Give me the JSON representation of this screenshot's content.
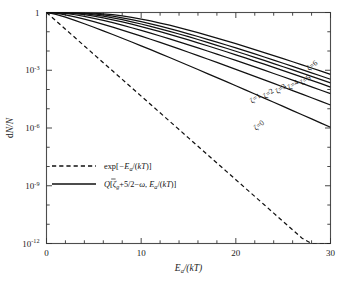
{
  "figure": {
    "kind": "semilog-line-plot",
    "background": "#ffffff",
    "frame_color": "#4d4d4d",
    "curve_color": "#111111"
  },
  "axes": {
    "x": {
      "label_parts": {
        "var": "E",
        "subscript": "a",
        "div": "/(",
        "k": "k",
        "T": "T",
        "close": ")"
      },
      "label": "Ea/(kT)",
      "ticks": [
        "0",
        "10",
        "20",
        "30"
      ],
      "tick_values": [
        0,
        10,
        20,
        30
      ],
      "minor_step": 2,
      "range": [
        0,
        30
      ],
      "scale": "linear"
    },
    "y": {
      "label": "dN/N",
      "label_parts": {
        "d": "d",
        "N1": "N",
        "slash": "/",
        "N2": "N"
      },
      "ticks": [
        {
          "mantissa": "1",
          "exponent": ""
        },
        {
          "mantissa": "10",
          "exponent": "-3"
        },
        {
          "mantissa": "10",
          "exponent": "-6"
        },
        {
          "mantissa": "10",
          "exponent": "-9"
        },
        {
          "mantissa": "10",
          "exponent": "-12"
        }
      ],
      "tick_exponents": [
        0,
        -3,
        -6,
        -9,
        -12
      ],
      "range": [
        -12,
        0
      ],
      "scale": "log10"
    }
  },
  "legend": {
    "position": "center-left",
    "entries": [
      {
        "style": "dashed",
        "text": "exp[-Ea/(kT)]",
        "parts": {
          "fn": "exp[",
          "minus": "−",
          "E": "E",
          "sub": "a",
          "div": "/(",
          "k": "k",
          "T": "T",
          "tail": ")]"
        }
      },
      {
        "style": "solid",
        "text": "Q[ζg+5/2-ω, Ea/(kT)]",
        "parts": {
          "Q": "Q",
          "open": "[",
          "zeta": "ζ",
          "zsub": "g",
          "mid": "+5/2",
          "minus": "−",
          "omega": "ω",
          "comma": ", ",
          "E": "E",
          "esub": "a",
          "div": "/(",
          "k": "k",
          "T": "T",
          "tail": ")]"
        }
      }
    ]
  },
  "curve_labels": [
    {
      "id": "zeta-0",
      "zeta": "0",
      "text": "ζ=0",
      "x_data": 22.6,
      "y_exp": -5.95,
      "rotation": -38
    },
    {
      "id": "zeta-1",
      "zeta": "1",
      "text": "ζ=1",
      "x_data": 22.2,
      "y_exp": -4.55,
      "rotation": -38
    },
    {
      "id": "zeta-2",
      "zeta": "2",
      "text": "ζ=2",
      "x_data": 23.6,
      "y_exp": -4.3,
      "rotation": -38
    },
    {
      "id": "zeta-3",
      "zeta": "3",
      "text": "ζ=3",
      "x_data": 24.9,
      "y_exp": -4.05,
      "rotation": -38
    },
    {
      "id": "zeta-4",
      "zeta": "4",
      "text": "ζ=4",
      "x_data": 26.2,
      "y_exp": -3.85,
      "rotation": -38
    },
    {
      "id": "zeta-5",
      "zeta": "5",
      "text": "ζ=5",
      "x_data": 27.5,
      "y_exp": -3.6,
      "rotation": -38
    },
    {
      "id": "zeta-6",
      "zeta": "6",
      "text": "ζ=6",
      "x_data": 28.2,
      "y_exp": -2.85,
      "rotation": -38
    }
  ],
  "chart_data": {
    "type": "line",
    "title": "",
    "xlabel": "Ea/(kT)",
    "ylabel": "dN/N",
    "xlim": [
      0,
      30
    ],
    "ylim": [
      1e-12,
      1
    ],
    "yscale": "log",
    "grid": false,
    "legend_position": "center-left",
    "x": [
      0,
      1,
      2,
      3,
      4,
      5,
      6,
      7,
      8,
      9,
      10,
      11,
      12,
      13,
      14,
      15,
      16,
      17,
      18,
      19,
      20,
      21,
      22,
      23,
      24,
      25,
      26,
      27,
      28,
      29,
      30
    ],
    "series": [
      {
        "name": "exp[-Ea/(kT)]",
        "style": "dashed",
        "shape_param": null,
        "values": [
          1,
          0.368,
          0.135,
          0.0498,
          0.0183,
          0.00674,
          0.00248,
          0.000912,
          0.000335,
          0.000123,
          4.54e-05,
          1.67e-05,
          6.14e-06,
          2.26e-06,
          8.32e-07,
          3.06e-07,
          1.13e-07,
          4.14e-08,
          1.52e-08,
          5.6e-09,
          2.06e-09,
          7.58e-10,
          2.79e-10,
          1.03e-10,
          3.78e-11,
          1.39e-11,
          5.11e-12,
          1.88e-12,
          6.91e-13,
          2.54e-13,
          9.36e-14
        ]
      },
      {
        "name": "ζ=0",
        "style": "solid",
        "shape_param": 1.5,
        "values": [
          1,
          0.801,
          0.572,
          0.391,
          0.261,
          0.172,
          0.112,
          0.072,
          0.0462,
          0.0295,
          0.0186,
          0.0117,
          0.00734,
          0.00458,
          0.00285,
          0.00177,
          0.00109,
          0.000674,
          0.000415,
          0.000255,
          0.000156,
          9.56e-05,
          5.84e-05,
          3.56e-05,
          2.17e-05,
          1.32e-05,
          8.03e-06,
          4.88e-06,
          2.96e-06,
          1.8e-06,
          1.09e-06
        ]
      },
      {
        "name": "ζ=1",
        "style": "solid",
        "shape_param": 2.5,
        "values": [
          1,
          0.92,
          0.761,
          0.598,
          0.453,
          0.335,
          0.243,
          0.173,
          0.122,
          0.0854,
          0.0592,
          0.0407,
          0.0278,
          0.0189,
          0.0128,
          0.00859,
          0.00575,
          0.00383,
          0.00255,
          0.00169,
          0.00112,
          0.000735,
          0.000483,
          0.000317,
          0.000207,
          0.000135,
          8.82e-05,
          5.74e-05,
          3.73e-05,
          2.42e-05,
          1.57e-05
        ]
      },
      {
        "name": "ζ=2",
        "style": "solid",
        "shape_param": 3.5,
        "values": [
          1,
          0.974,
          0.888,
          0.764,
          0.63,
          0.501,
          0.388,
          0.294,
          0.219,
          0.161,
          0.117,
          0.0842,
          0.06,
          0.0424,
          0.0298,
          0.0208,
          0.0145,
          0.01,
          0.00689,
          0.00473,
          0.00323,
          0.0022,
          0.00149,
          0.00101,
          0.00068,
          0.000458,
          0.000307,
          0.000206,
          0.000138,
          9.18e-05,
          6.11e-05
        ]
      },
      {
        "name": "ζ=3",
        "style": "solid",
        "shape_param": 4.5,
        "values": [
          1,
          0.992,
          0.955,
          0.877,
          0.769,
          0.647,
          0.527,
          0.418,
          0.325,
          0.248,
          0.186,
          0.138,
          0.101,
          0.0733,
          0.0527,
          0.0376,
          0.0266,
          0.0187,
          0.0131,
          0.00913,
          0.00633,
          0.00437,
          0.00301,
          0.00206,
          0.00141,
          0.000958,
          0.00065,
          0.00044,
          0.000297,
          0.0002,
          0.000134
        ]
      },
      {
        "name": "ζ=4",
        "style": "solid",
        "shape_param": 5.5,
        "values": [
          1,
          0.998,
          0.983,
          0.941,
          0.866,
          0.762,
          0.645,
          0.529,
          0.422,
          0.33,
          0.253,
          0.191,
          0.142,
          0.105,
          0.0764,
          0.0552,
          0.0395,
          0.0281,
          0.0198,
          0.0139,
          0.00973,
          0.00677,
          0.00469,
          0.00323,
          0.00222,
          0.00152,
          0.00104,
          0.000707,
          0.00048,
          0.000325,
          0.000219
        ]
      },
      {
        "name": "ζ=5",
        "style": "solid",
        "shape_param": 6.5,
        "values": [
          1,
          0.999,
          0.994,
          0.974,
          0.931,
          0.859,
          0.761,
          0.646,
          0.532,
          0.426,
          0.334,
          0.257,
          0.194,
          0.145,
          0.107,
          0.0782,
          0.0566,
          0.0406,
          0.0289,
          0.0205,
          0.0144,
          0.0101,
          0.00703,
          0.00487,
          0.00336,
          0.00231,
          0.00159,
          0.00108,
          0.000738,
          0.000502,
          0.00034
        ]
      },
      {
        "name": "ζ=6",
        "style": "solid",
        "shape_param": 7.5,
        "values": [
          1,
          1.0,
          0.998,
          0.99,
          0.966,
          0.922,
          0.856,
          0.768,
          0.666,
          0.56,
          0.457,
          0.364,
          0.284,
          0.218,
          0.164,
          0.122,
          0.0898,
          0.0654,
          0.0472,
          0.0338,
          0.024,
          0.017,
          0.0119,
          0.00833,
          0.00579,
          0.00401,
          0.00277,
          0.0019,
          0.00131,
          0.000893,
          0.000609
        ]
      }
    ]
  }
}
